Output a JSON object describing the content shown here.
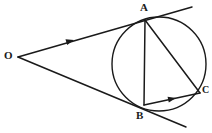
{
  "figure": {
    "background_color": "#ffffff",
    "stroke_color": "#1a1a1a",
    "width": 212,
    "height": 133
  },
  "labels": {
    "O": {
      "text": "O",
      "x": 4,
      "y": 50,
      "font_size": 11
    },
    "A": {
      "text": "A",
      "x": 140,
      "y": 2,
      "font_size": 11
    },
    "B": {
      "text": "B",
      "x": 136,
      "y": 110,
      "font_size": 11
    },
    "C": {
      "text": "C",
      "x": 202,
      "y": 85,
      "font_size": 10
    }
  },
  "points": {
    "O": {
      "x": 18,
      "y": 57
    },
    "A": {
      "x": 145,
      "y": 20
    },
    "B": {
      "x": 144,
      "y": 105
    },
    "C": {
      "x": 200,
      "y": 93
    }
  },
  "circle": {
    "center_x": 159,
    "center_y": 64,
    "radius": 47,
    "stroke_width": 1.4
  },
  "segments": {
    "tangent_upper": {
      "x1": 18,
      "y1": 57,
      "x2": 192,
      "y2": 7,
      "stroke_width": 1.5
    },
    "tangent_lower": {
      "x1": 18,
      "y1": 57,
      "x2": 186,
      "y2": 127,
      "stroke_width": 1.5
    },
    "chord_ab": {
      "x1": 145,
      "y1": 20,
      "x2": 144,
      "y2": 105,
      "stroke_width": 1.5
    },
    "chord_ac": {
      "x1": 145,
      "y1": 20,
      "x2": 200,
      "y2": 93,
      "stroke_width": 1.5
    },
    "chord_bc": {
      "x1": 144,
      "y1": 105,
      "x2": 200,
      "y2": 93,
      "stroke_width": 1.5
    }
  },
  "arrow_markers": {
    "on_tangent_upper": {
      "x": 72,
      "y": 41,
      "angle": -16,
      "size": 6
    },
    "on_chord_bc": {
      "x": 174,
      "y": 99,
      "angle": -12,
      "size": 6
    }
  }
}
